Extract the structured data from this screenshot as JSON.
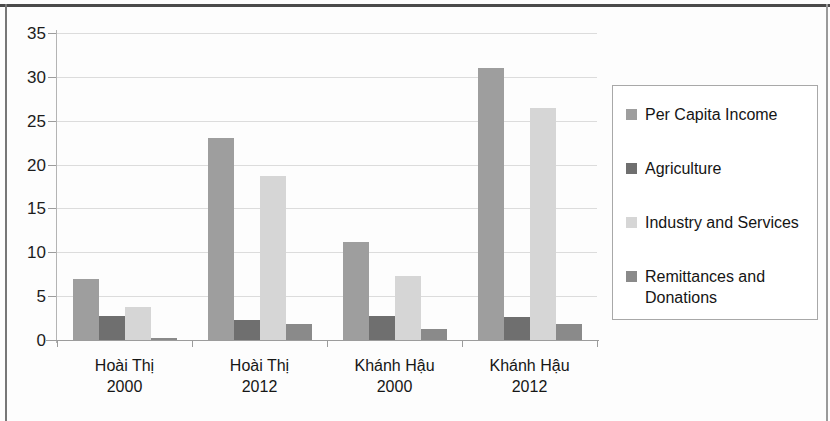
{
  "chart_data": {
    "type": "bar",
    "title": "",
    "xlabel": "",
    "ylabel": "",
    "ylim": [
      0,
      35
    ],
    "yticks": [
      0,
      5,
      10,
      15,
      20,
      25,
      30,
      35
    ],
    "grid": true,
    "legend_position": "right",
    "categories": [
      "Hoài Thị\n2000",
      "Hoài Thị\n2012",
      "Khánh Hậu\n2000",
      "Khánh Hậu\n2012"
    ],
    "category_lines": [
      [
        "Hoài Thị",
        "2000"
      ],
      [
        "Hoài Thị",
        "2012"
      ],
      [
        "Khánh Hậu",
        "2000"
      ],
      [
        "Khánh Hậu",
        "2012"
      ]
    ],
    "series": [
      {
        "name": "Per Capita Income",
        "color": "#9e9e9e",
        "values": [
          7.0,
          23.0,
          11.2,
          31.0
        ]
      },
      {
        "name": "Agriculture",
        "color": "#6f6f6f",
        "values": [
          2.7,
          2.3,
          2.7,
          2.6
        ]
      },
      {
        "name": "Industry and Services",
        "color": "#d6d6d6",
        "values": [
          3.8,
          18.7,
          7.3,
          26.5
        ]
      },
      {
        "name": "Remittances and\nDonations",
        "color": "#8a8a8a",
        "values": [
          0.25,
          1.8,
          1.3,
          1.8
        ]
      }
    ]
  },
  "legend": {
    "items": [
      {
        "label": "Per Capita Income"
      },
      {
        "label": "Agriculture"
      },
      {
        "label": "Industry and Services"
      },
      {
        "label": "Remittances and\nDonations"
      }
    ]
  }
}
